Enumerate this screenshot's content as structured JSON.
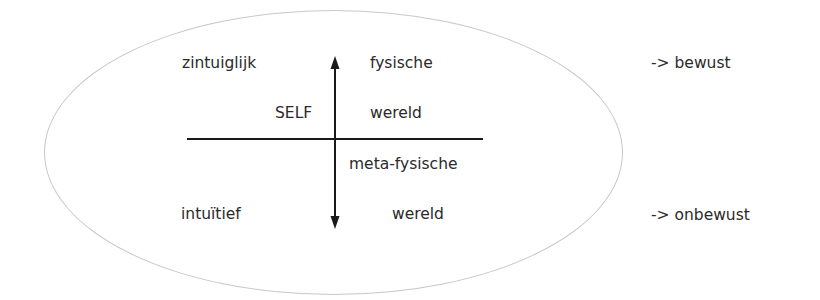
{
  "diagram": {
    "labels": {
      "top_left": "zintuiglijk",
      "top_right_1": "fysische",
      "top_right_2": "wereld",
      "center": "SELF",
      "bottom_right_1": "meta-fysische",
      "bottom_right_2": "wereld",
      "bottom_left": "intuïtief",
      "right_top": "-> bewust",
      "right_bottom": "-> onbewust"
    },
    "colors": {
      "ellipse": "#c8c8c8",
      "lines": "#1a1a1a",
      "text": "#2a2a2a"
    }
  }
}
